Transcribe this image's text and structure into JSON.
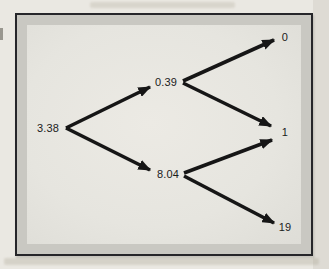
{
  "figure": {
    "type": "binomial-tree",
    "root": {
      "value": "3.38"
    },
    "level1": [
      {
        "id": "up",
        "value": "0.39"
      },
      {
        "id": "down",
        "value": "8.04"
      }
    ],
    "leaves": [
      {
        "id": "top",
        "value": "0"
      },
      {
        "id": "middle",
        "value": "1"
      },
      {
        "id": "bottom",
        "value": "19"
      }
    ],
    "edges": [
      {
        "from": "3.38",
        "to": "0.39"
      },
      {
        "from": "3.38",
        "to": "8.04"
      },
      {
        "from": "0.39",
        "to": "0"
      },
      {
        "from": "0.39",
        "to": "1"
      },
      {
        "from": "8.04",
        "to": "1"
      },
      {
        "from": "8.04",
        "to": "19"
      }
    ]
  },
  "colors": {
    "page_bg": "#eae8e2",
    "box_border": "#26262a",
    "box_band": "#c9c8c2",
    "box_interior": "#e8e7e1",
    "arrow": "#161616",
    "text": "#1b1b1b"
  }
}
